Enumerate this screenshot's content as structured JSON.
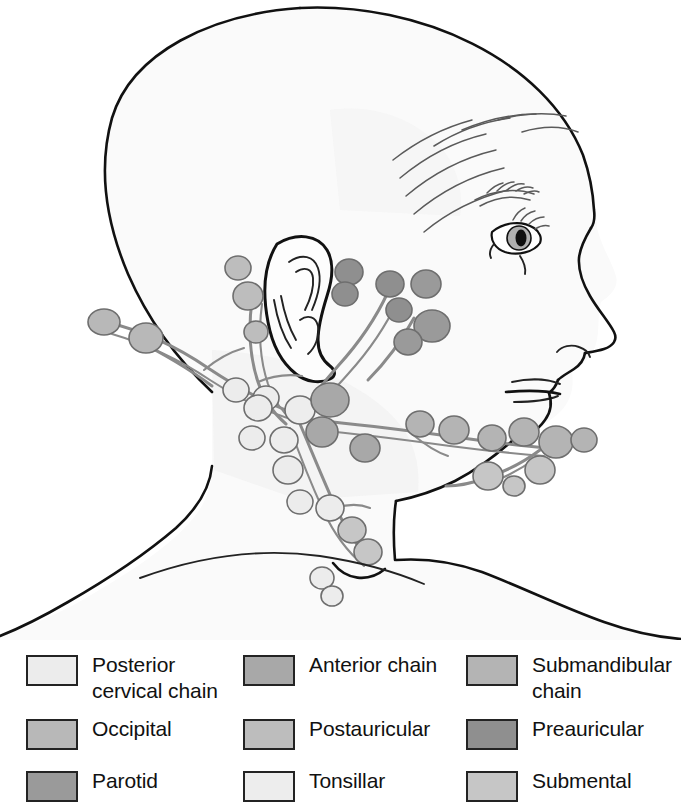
{
  "figure": {
    "view": "lateral profile, right side"
  },
  "palette": {
    "posterior_cervical_chain": "#ececec",
    "anterior_chain": "#a8a8a8",
    "submandibular_chain": "#b4b4b4",
    "occipital": "#b8b8b8",
    "postauricular": "#bdbdbd",
    "preauricular": "#8f8f8f",
    "parotid": "#9a9a9a",
    "tonsillar": "#ededed",
    "submental": "#c6c6c6",
    "skin": "#fafafa",
    "outline": "#111111",
    "vessel": "#8a8a8a"
  },
  "legend": {
    "rows": [
      {
        "cells": [
          {
            "swatch_key": "posterior_cervical_chain",
            "label": "Posterior\ncervical chain"
          },
          {
            "swatch_key": "anterior_chain",
            "label": "Anterior chain"
          },
          {
            "swatch_key": "submandibular_chain",
            "label": "Submandibular\nchain"
          }
        ]
      },
      {
        "cells": [
          {
            "swatch_key": "occipital",
            "label": "Occipital"
          },
          {
            "swatch_key": "postauricular",
            "label": "Postauricular"
          },
          {
            "swatch_key": "preauricular",
            "label": "Preauricular"
          }
        ]
      },
      {
        "cells": [
          {
            "swatch_key": "parotid",
            "label": "Parotid"
          },
          {
            "swatch_key": "tonsillar",
            "label": "Tonsillar"
          },
          {
            "swatch_key": "submental",
            "label": "Submental"
          }
        ]
      }
    ]
  },
  "anatomy": {
    "features": [
      "cranium",
      "forehead",
      "eyebrow",
      "eye",
      "nose",
      "lips",
      "chin",
      "ear",
      "neck",
      "shoulder",
      "clavicle",
      "hair-strands"
    ],
    "node_groups": [
      {
        "name": "occipital",
        "count": 2,
        "region": "posterior skull base"
      },
      {
        "name": "postauricular",
        "count": 3,
        "region": "behind ear"
      },
      {
        "name": "preauricular",
        "count": 4,
        "region": "in front of ear"
      },
      {
        "name": "parotid",
        "count": 3,
        "region": "over parotid gland"
      },
      {
        "name": "tonsillar",
        "count": 3,
        "region": "angle of mandible"
      },
      {
        "name": "submandibular_chain",
        "count": 6,
        "region": "along mandible"
      },
      {
        "name": "submental",
        "count": 3,
        "region": "beneath chin"
      },
      {
        "name": "anterior_chain",
        "count": 5,
        "region": "anterior cervical"
      },
      {
        "name": "posterior_cervical_chain",
        "count": 6,
        "region": "posterior cervical"
      }
    ]
  }
}
